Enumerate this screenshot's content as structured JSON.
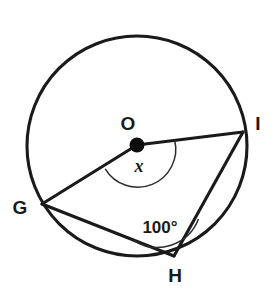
{
  "figure": {
    "type": "circle-geometry-diagram",
    "background_color": "#ffffff",
    "stroke_color": "#1a1a1a",
    "circle": {
      "center_label": "O",
      "center_x": 137,
      "center_y": 146,
      "radius": 111
    },
    "points": [
      {
        "label": "G",
        "x": 42,
        "y": 204,
        "label_x": 20,
        "label_y": 214
      },
      {
        "label": "H",
        "x": 174,
        "y": 256,
        "label_x": 167,
        "label_y": 282
      },
      {
        "label": "I",
        "x": 243,
        "y": 132,
        "label_x": 252,
        "label_y": 130
      },
      {
        "label": "O",
        "x": 137,
        "y": 145,
        "label_x": 128,
        "label_y": 130
      }
    ],
    "segments": [
      {
        "name": "radius-OG",
        "from": "O",
        "to": "G"
      },
      {
        "name": "radius-OI",
        "from": "O",
        "to": "I"
      },
      {
        "name": "chord-GH",
        "from": "G",
        "to": "H"
      },
      {
        "name": "chord-HI",
        "from": "H",
        "to": "I"
      }
    ],
    "angles": [
      {
        "name": "central-angle-GOI",
        "vertex": "O",
        "value": "x",
        "is_unknown": true,
        "label_x": 139,
        "label_y": 172,
        "arc_radius": 38
      },
      {
        "name": "inscribed-angle-GHI",
        "vertex": "H",
        "value": "100°",
        "is_unknown": false,
        "label_x": 140,
        "label_y": 233,
        "arc_radius": 44
      }
    ]
  }
}
